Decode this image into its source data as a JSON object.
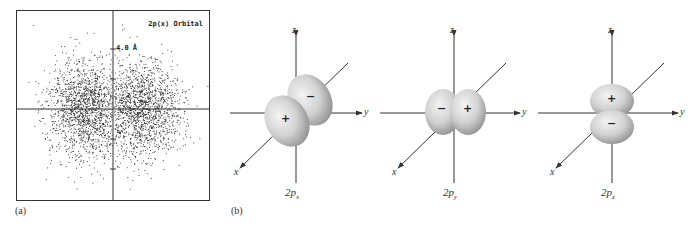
{
  "figure": {
    "panel_a": {
      "label": "(a)",
      "plot_title": "2p(x) Orbital",
      "scale_label": "4.0 Å",
      "description": "dot-density plot of 2p(x) orbital with two lobes along horizontal axis"
    },
    "panel_b": {
      "label": "(b)",
      "orbitals": [
        {
          "caption_main": "2p",
          "caption_sub": "x",
          "axes": {
            "z": "z",
            "y": "y",
            "x": "x"
          },
          "lobe_signs": [
            "+",
            "−"
          ]
        },
        {
          "caption_main": "2p",
          "caption_sub": "y",
          "axes": {
            "z": "z",
            "y": "y",
            "x": "x"
          },
          "lobe_signs": [
            "−",
            "+"
          ]
        },
        {
          "caption_main": "2p",
          "caption_sub": "z",
          "axes": {
            "z": "z",
            "y": "y",
            "x": "x"
          },
          "lobe_signs": [
            "+",
            "−"
          ]
        }
      ]
    },
    "colors": {
      "lobe_light": "#e6e6e6",
      "lobe_dark": "#9a9a9a",
      "axis": "#333333",
      "dots": "#222222"
    }
  }
}
